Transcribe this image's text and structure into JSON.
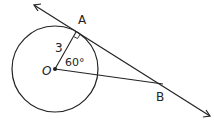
{
  "diagram": {
    "title": "",
    "circle": {
      "center_label": "O",
      "radius_label": "3"
    },
    "points": {
      "A": {
        "label": "A"
      },
      "B": {
        "label": "B"
      },
      "O": {
        "label": "O"
      }
    },
    "angle_label": "60°",
    "segment_label": "3",
    "right_angle_at": "A",
    "colors": {
      "stroke": "#222222",
      "background": "#ffffff"
    }
  }
}
